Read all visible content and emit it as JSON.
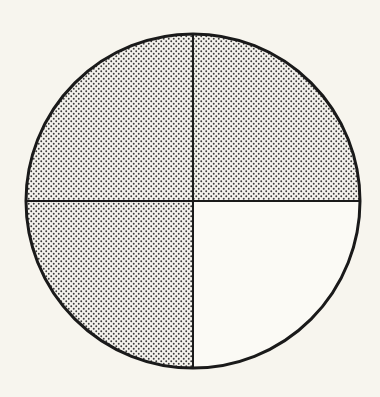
{
  "diagram": {
    "type": "fraction-circle",
    "total_parts": 4,
    "shaded_parts": 3,
    "fraction": "3/4",
    "center": [
      193,
      201
    ],
    "radius": 167,
    "quadrants": [
      {
        "position": "top-left",
        "shaded": true
      },
      {
        "position": "top-right",
        "shaded": true
      },
      {
        "position": "bottom-left",
        "shaded": true
      },
      {
        "position": "bottom-right",
        "shaded": false
      }
    ],
    "colors": {
      "background": "#f7f5ee",
      "outline": "#1a1a1a",
      "dot": "#3a3a3a",
      "shade_bg": "#f4f2ec",
      "unshaded_fill": "#fbfaf5"
    }
  }
}
